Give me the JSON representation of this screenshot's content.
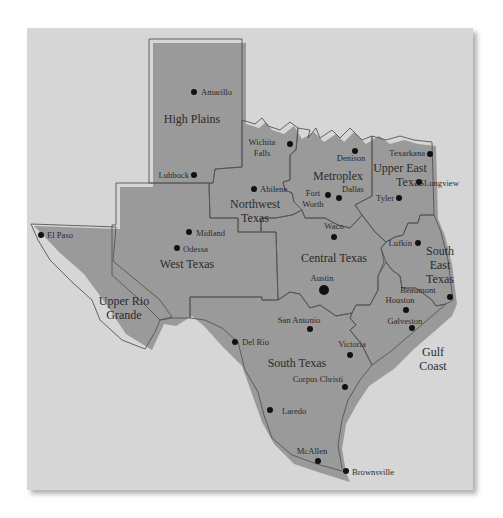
{
  "map": {
    "title": "Texas Regions",
    "colors": {
      "page_background": "#ffffff",
      "frame_background": "#d6d6d6",
      "light_region": "#e6e6e6",
      "medium_region": "#d2d2d2",
      "dark_region": "#b9b9b9",
      "shadow": "#9a9a9a",
      "border": "#555555",
      "city_dot": "#111111"
    },
    "regions": [
      {
        "name": "High Plains",
        "lines": [
          "High Plains"
        ]
      },
      {
        "name": "Northwest Texas",
        "lines": [
          "Northwest",
          "Texas"
        ]
      },
      {
        "name": "Metroplex",
        "lines": [
          "Metroplex"
        ]
      },
      {
        "name": "Upper East Texas",
        "lines": [
          "Upper East",
          "Texas"
        ]
      },
      {
        "name": "West Texas",
        "lines": [
          "West Texas"
        ]
      },
      {
        "name": "Central Texas",
        "lines": [
          "Central Texas"
        ]
      },
      {
        "name": "South East Texas",
        "lines": [
          "South",
          "East",
          "Texas"
        ]
      },
      {
        "name": "Upper Rio Grande",
        "lines": [
          "Upper Rio",
          "Grande"
        ]
      },
      {
        "name": "South Texas",
        "lines": [
          "South Texas"
        ]
      },
      {
        "name": "Gulf Coast",
        "lines": [
          "Gulf",
          "Coast"
        ]
      }
    ],
    "cities": [
      {
        "name": "Amarillo"
      },
      {
        "name": "Lubbock"
      },
      {
        "name": "Wichita Falls",
        "lines": [
          "Wichita",
          "Falls"
        ]
      },
      {
        "name": "Abilene"
      },
      {
        "name": "Denison"
      },
      {
        "name": "Fort Worth",
        "lines": [
          "Fort",
          "Worth"
        ]
      },
      {
        "name": "Dallas"
      },
      {
        "name": "Texarkana"
      },
      {
        "name": "Longview"
      },
      {
        "name": "Tyler"
      },
      {
        "name": "El Paso"
      },
      {
        "name": "Midland"
      },
      {
        "name": "Odessa"
      },
      {
        "name": "Waco"
      },
      {
        "name": "Austin",
        "capital": true
      },
      {
        "name": "Lufkin"
      },
      {
        "name": "Beaumont"
      },
      {
        "name": "Houston"
      },
      {
        "name": "Galveston"
      },
      {
        "name": "San Antonio"
      },
      {
        "name": "Del Rio"
      },
      {
        "name": "Victoria"
      },
      {
        "name": "Corpus Christi"
      },
      {
        "name": "Laredo"
      },
      {
        "name": "McAllen"
      },
      {
        "name": "Brownsville"
      }
    ]
  }
}
